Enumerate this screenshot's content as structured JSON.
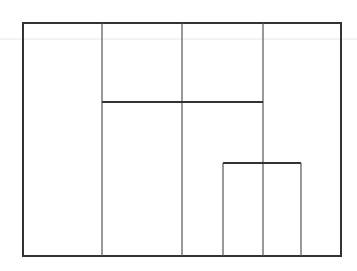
{
  "canvas": {
    "width": 357,
    "height": 271,
    "background": "#ffffff"
  },
  "colors": {
    "stroke": "#333333",
    "inner_stroke": "#555555",
    "faint": "#e6e6e6"
  },
  "shapes": {
    "faint_line": {
      "x1": 0,
      "y1": 39,
      "x2": 357,
      "y2": 39
    },
    "outer_rect": {
      "x": 23,
      "y": 23,
      "w": 318,
      "h": 233
    },
    "vlines": [
      {
        "x": 102,
        "y1": 23,
        "y2": 256
      },
      {
        "x": 182,
        "y1": 23,
        "y2": 256
      },
      {
        "x": 263,
        "y1": 23,
        "y2": 256
      }
    ],
    "hline": {
      "x1": 102,
      "x2": 263,
      "y": 102
    },
    "inner_rect": {
      "x": 223,
      "y": 163,
      "w": 78,
      "h": 93
    }
  }
}
